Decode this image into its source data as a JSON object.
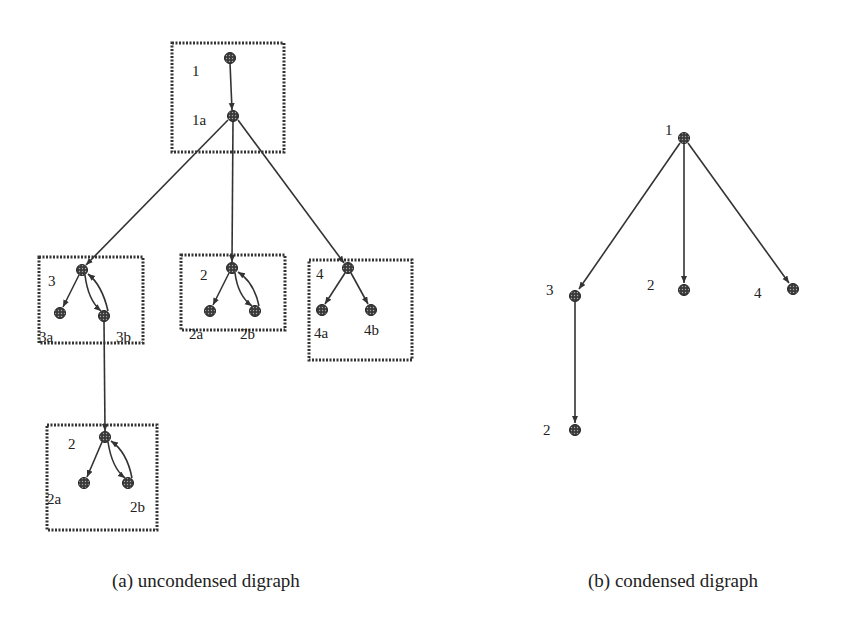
{
  "figure": {
    "panel_a": {
      "caption": "(a) uncondensed digraph",
      "groups": [
        {
          "id": "g1",
          "label": "1",
          "box": [
            172,
            43,
            112,
            109
          ]
        },
        {
          "id": "g3",
          "label": "3",
          "box": [
            39,
            257,
            104,
            86
          ]
        },
        {
          "id": "g2_mid",
          "label": "2",
          "box": [
            181,
            255,
            104,
            75
          ]
        },
        {
          "id": "g4",
          "label": "4",
          "box": [
            309,
            260,
            103,
            100
          ]
        },
        {
          "id": "g2_bottom",
          "label": "2",
          "box": [
            47,
            425,
            110,
            105
          ]
        }
      ],
      "node_labels": {
        "n1": "1",
        "n1a": "1a",
        "n3": "3",
        "n3a": "3a",
        "n3b": "3b",
        "n2": "2",
        "n2a": "2a",
        "n2b": "2b",
        "n4": "4",
        "n4a": "4a",
        "n4b": "4b",
        "n2c": "2",
        "n2ca": "2a",
        "n2cb": "2b"
      }
    },
    "panel_b": {
      "caption": "(b) condensed digraph",
      "node_labels": {
        "c1": "1",
        "c3": "3",
        "c2": "2",
        "c4": "4",
        "c2b": "2"
      }
    },
    "colors": {
      "node_fill": "#4a4a4a",
      "edge": "#333333",
      "box": "#333333"
    }
  }
}
